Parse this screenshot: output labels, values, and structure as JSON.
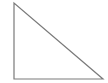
{
  "diagram": {
    "shape": "right-triangle",
    "stroke_color": "#7a7a7a",
    "fill_color": "#ffffff",
    "vertices": [
      [
        14,
        3
      ],
      [
        14,
        79
      ],
      [
        103,
        79
      ]
    ]
  }
}
